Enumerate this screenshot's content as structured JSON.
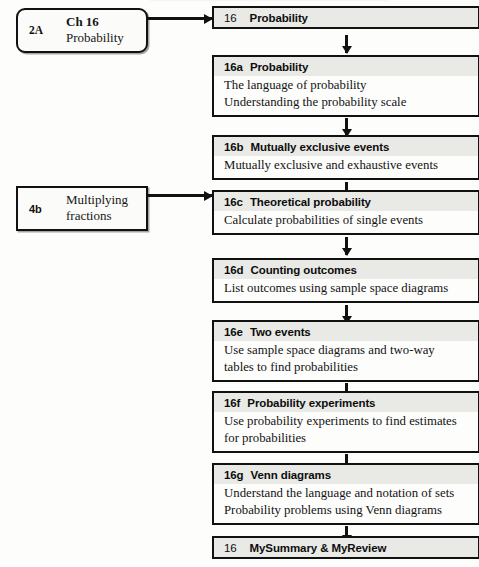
{
  "diagram": {
    "colors": {
      "border": "#111111",
      "header_fill": "#e9e9e6",
      "body_fill": "#fdfdfc",
      "page_background": "#ffffff"
    },
    "prerequisites": [
      {
        "code": "2A",
        "line1": "Ch 16",
        "line2": "Probability",
        "shape": "rounded"
      },
      {
        "code": "4b",
        "line1": "Multiplying",
        "line2": "fractions",
        "shape": "square"
      }
    ],
    "nodes": [
      {
        "num": "16",
        "title": "Probability",
        "lines": []
      },
      {
        "num": "16a",
        "title": "Probability",
        "lines": [
          "The language of probability",
          "Understanding the probability scale"
        ]
      },
      {
        "num": "16b",
        "title": "Mutually exclusive events",
        "lines": [
          "Mutually exclusive and exhaustive events"
        ]
      },
      {
        "num": "16c",
        "title": "Theoretical probability",
        "lines": [
          "Calculate probabilities of single events"
        ]
      },
      {
        "num": "16d",
        "title": "Counting outcomes",
        "lines": [
          "List outcomes using sample space diagrams"
        ]
      },
      {
        "num": "16e",
        "title": "Two events",
        "lines": [
          "Use sample space diagrams and two-way",
          "tables to find probabilities"
        ]
      },
      {
        "num": "16f",
        "title": "Probability experiments",
        "lines": [
          "Use probability experiments to find estimates",
          "for probabilities"
        ]
      },
      {
        "num": "16g",
        "title": "Venn diagrams",
        "lines": [
          "Understand the language and notation of sets",
          "Probability problems using Venn diagrams"
        ]
      },
      {
        "num": "16",
        "title": "MySummary & MyReview",
        "lines": []
      }
    ]
  }
}
